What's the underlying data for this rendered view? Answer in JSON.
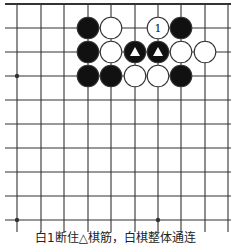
{
  "diagram": {
    "type": "go-board-fragment",
    "grid": {
      "x_lines": [
        17,
        41,
        64,
        88,
        111,
        135,
        158,
        181,
        205,
        228
      ],
      "y_lines": [
        4,
        28,
        52,
        76,
        100,
        124,
        148,
        172,
        196,
        220
      ],
      "h_line_x_start": 5,
      "h_line_x_end": 231,
      "v_line_y_start": 4,
      "v_line_y_end": 232,
      "top_edge": true
    },
    "star_points": [
      {
        "col": 0,
        "row": 3
      },
      {
        "col": 0,
        "row": 9
      },
      {
        "col": 6,
        "row": 9
      }
    ],
    "stones": [
      {
        "col": 3,
        "row": 1,
        "color": "black"
      },
      {
        "col": 4,
        "row": 1,
        "color": "white"
      },
      {
        "col": 6,
        "row": 1,
        "color": "white",
        "label": "1"
      },
      {
        "col": 7,
        "row": 1,
        "color": "black"
      },
      {
        "col": 3,
        "row": 2,
        "color": "black"
      },
      {
        "col": 4,
        "row": 2,
        "color": "white"
      },
      {
        "col": 5,
        "row": 2,
        "color": "black",
        "mark": "triangle"
      },
      {
        "col": 6,
        "row": 2,
        "color": "black",
        "mark": "triangle"
      },
      {
        "col": 7,
        "row": 2,
        "color": "white"
      },
      {
        "col": 8,
        "row": 2,
        "color": "white"
      },
      {
        "col": 3,
        "row": 3,
        "color": "black"
      },
      {
        "col": 4,
        "row": 3,
        "color": "black"
      },
      {
        "col": 5,
        "row": 3,
        "color": "white"
      },
      {
        "col": 6,
        "row": 3,
        "color": "white"
      },
      {
        "col": 7,
        "row": 3,
        "color": "black"
      }
    ],
    "colors": {
      "line": "#333333",
      "black_stone": "#111111",
      "white_stone": "#ffffff",
      "stone_outline": "#333333"
    }
  },
  "caption": "白1断住△棋筋，白棋整体通连"
}
